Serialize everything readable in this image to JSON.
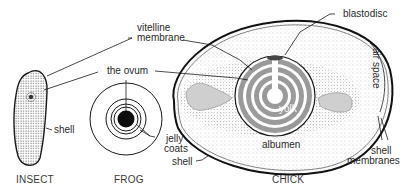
{
  "diagram": {
    "subjects": [
      {
        "id": "insect",
        "caption": "INSECT"
      },
      {
        "id": "frog",
        "caption": "FROG"
      },
      {
        "id": "chick",
        "caption": "CHICK"
      }
    ],
    "labels": {
      "vitelline_membrane_line1": "vitelline",
      "vitelline_membrane_line2": "membrane",
      "the_ovum": "the ovum",
      "blastodisc": "blastodisc",
      "air_space": "air space",
      "shell_insect": "shell",
      "jelly_coats_line1": "jelly",
      "jelly_coats_line2": "coats",
      "yolk": "yolk",
      "albumen": "albumen",
      "shell_chick": "shell",
      "shell_membranes_line1": "shell",
      "shell_membranes_line2": "membranes"
    },
    "colors": {
      "line": "#1a1a1a",
      "stipple": "#8a8a8a",
      "yolk_band": "#9a9a9a",
      "text": "#2a2a2a"
    }
  }
}
